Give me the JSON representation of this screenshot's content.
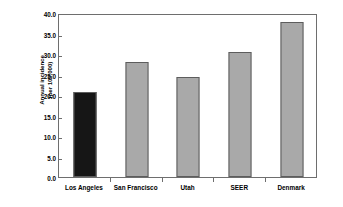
{
  "chart_data": {
    "type": "bar",
    "title": "",
    "subtitle": "",
    "xlabel": "",
    "ylabel": "Annual incidence (per 100,000)",
    "ylabel_lines": [
      "Annual incidence",
      "(per 100,000)"
    ],
    "categories": [
      "Los Angeles",
      "San Francisco",
      "Utah",
      "SEER",
      "Denmark"
    ],
    "values": [
      20.8,
      28.0,
      24.4,
      30.5,
      37.8
    ],
    "ylim": [
      0.0,
      40.0
    ],
    "ytick_values": [
      0.0,
      5.0,
      10.0,
      15.0,
      20.0,
      25.0,
      30.0,
      35.0,
      40.0
    ],
    "ytick_labels": [
      "0.0",
      "5.0",
      "10.0",
      "15.0",
      "20.0",
      "25.0",
      "30.0",
      "35.0",
      "40.0"
    ],
    "grid": false,
    "legend": null,
    "bar_colors": [
      "#161616",
      "#a9a9a9",
      "#a9a9a9",
      "#a9a9a9",
      "#a9a9a9"
    ],
    "bar_border_color": "#5d5d5d",
    "frame_color": "#6e6e6e",
    "background_color": "#ffffff",
    "highlight_color": "#161616",
    "series_color": "#a9a9a9"
  }
}
